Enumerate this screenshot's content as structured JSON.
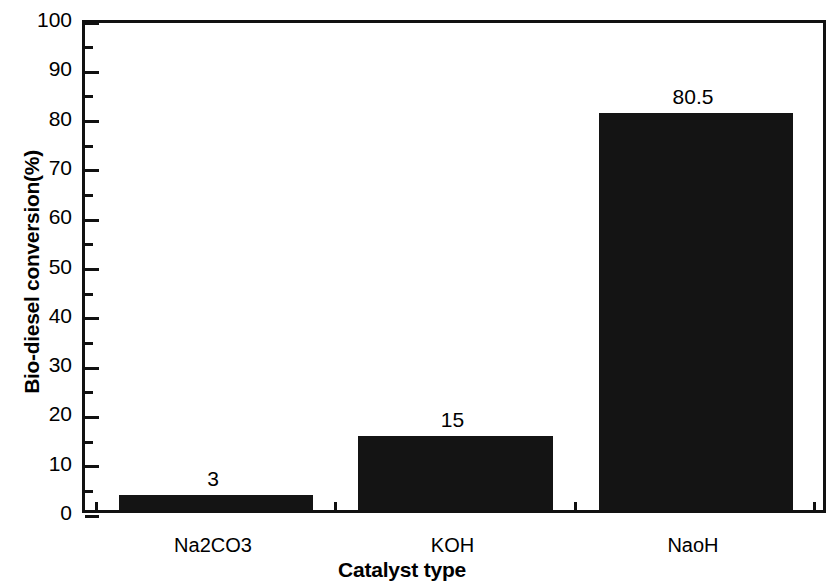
{
  "chart_data": {
    "type": "bar",
    "title": "",
    "xlabel": "Catalyst type",
    "ylabel": "Bio-diesel conversion(%)",
    "categories": [
      "Na2CO3",
      "KOH",
      "NaoH"
    ],
    "values": [
      3,
      15,
      80.5
    ],
    "data_labels": [
      "3",
      "15",
      "80.5"
    ],
    "ylim": [
      0,
      100
    ],
    "ytick_labels": [
      "0",
      "10",
      "20",
      "30",
      "40",
      "50",
      "60",
      "70",
      "80",
      "90",
      "100"
    ],
    "ytick_values": [
      0,
      10,
      20,
      30,
      40,
      50,
      60,
      70,
      80,
      90,
      100
    ],
    "ytick_minor_step": 5,
    "grid": false,
    "legend": null,
    "bar_color": "#141414",
    "axis_color": "#111111",
    "background_color": "#ffffff"
  },
  "figure": {
    "frame_note": "right spine cropped by image edge",
    "tick_direction": "in"
  }
}
